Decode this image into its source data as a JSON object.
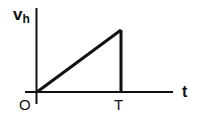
{
  "diagram": {
    "y_axis_label": "v",
    "y_axis_label_sub": "h",
    "x_axis_label": "t",
    "origin_label": "O",
    "tick_label": "T",
    "shape": "sawtooth ramp: linear rise from origin to peak at t=T, then vertical drop to zero",
    "colors": {
      "line": "#111111",
      "background": "#ffffff"
    }
  }
}
